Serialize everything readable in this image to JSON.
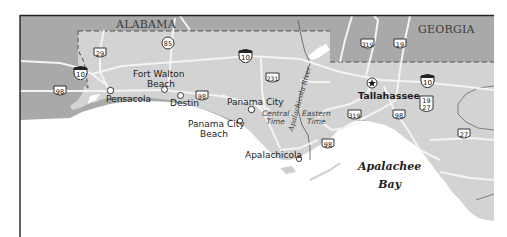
{
  "map": {
    "states": [
      {
        "id": "alabama",
        "label": "ALABAMA"
      },
      {
        "id": "georgia",
        "label": "GEORGIA"
      }
    ],
    "cities": [
      {
        "id": "pensacola",
        "label": "Pensacola"
      },
      {
        "id": "fort-walton-beach",
        "label_line1": "Fort Walton",
        "label_line2": "Beach"
      },
      {
        "id": "destin",
        "label": "Destin"
      },
      {
        "id": "panama-city",
        "label": "Panama City"
      },
      {
        "id": "panama-city-beach",
        "label_line1": "Panama City",
        "label_line2": "Beach"
      },
      {
        "id": "apalachicola",
        "label": "Apalachicola"
      },
      {
        "id": "tallahassee",
        "label": "Tallahassee",
        "capital": true
      }
    ],
    "time_zones": {
      "central_line1": "Central",
      "central_line2": "Time",
      "eastern_line1": "Eastern",
      "eastern_line2": "Time"
    },
    "water": {
      "river": "Apalachicola River",
      "bay_line1": "Apalachee",
      "bay_line2": "Bay"
    },
    "highways": {
      "interstate": [
        {
          "id": "i10-west",
          "number": "10"
        },
        {
          "id": "i10-central",
          "number": "10"
        },
        {
          "id": "i10-east",
          "number": "10"
        }
      ],
      "us": [
        {
          "id": "us98-west",
          "number": "98"
        },
        {
          "id": "us98-destin",
          "number": "98"
        },
        {
          "id": "us98-apalachicola",
          "number": "98"
        },
        {
          "id": "us98-east",
          "number": "98"
        },
        {
          "id": "us29",
          "number": "29"
        },
        {
          "id": "us231",
          "number": "231"
        },
        {
          "id": "us319-north",
          "number": "319"
        },
        {
          "id": "us319-south",
          "number": "319"
        },
        {
          "id": "us19-north",
          "number": "19"
        },
        {
          "id": "us19-27",
          "number_line1": "19",
          "number_line2": "27"
        },
        {
          "id": "us27",
          "number": "27"
        }
      ],
      "state": [
        {
          "id": "sr85",
          "number": "85"
        }
      ]
    },
    "colors": {
      "neighbor_state": "#a9a9a9",
      "florida": "#d3d3d3",
      "water": "#ffffff",
      "road": "#f4f4f4",
      "border": "#555555",
      "frame": "#222222"
    }
  }
}
